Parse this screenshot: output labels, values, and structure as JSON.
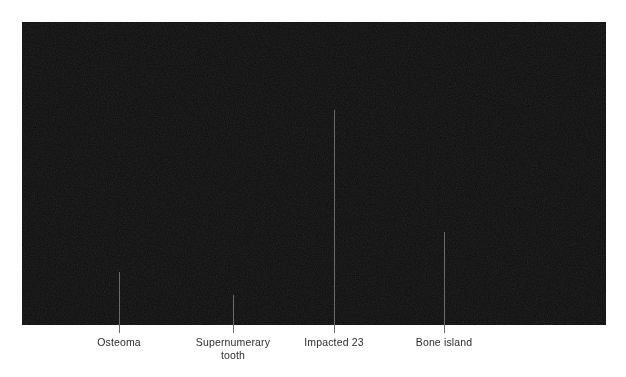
{
  "figure": {
    "type": "panoramic-dental-radiograph",
    "caption_labels": [
      {
        "id": "osteoma",
        "text": "Osteoma",
        "line_x": 119,
        "line_top": 272,
        "line_bottom": 333,
        "label_x": 119,
        "label_y": 336
      },
      {
        "id": "supernumerary-tooth",
        "text": "Supernumerary\ntooth",
        "line_x": 233,
        "line_top": 295,
        "line_bottom": 333,
        "label_x": 233,
        "label_y": 336
      },
      {
        "id": "impacted-23",
        "text": "Impacted 23",
        "line_x": 334,
        "line_top": 110,
        "line_bottom": 333,
        "label_x": 334,
        "label_y": 336
      },
      {
        "id": "bone-island",
        "text": "Bone island",
        "line_x": 444,
        "line_top": 232,
        "line_bottom": 333,
        "label_x": 444,
        "label_y": 336
      }
    ],
    "colors": {
      "page_background": "#ffffff",
      "label_text": "#2b2b2b",
      "leader_line": "#6b6b6b",
      "film_background": "#0b0b0b",
      "bone_bright": "#d8d4cc",
      "enamel_bright": "#efece4",
      "restoration_white": "#ffffff",
      "soft_tissue_mid": "#6e6e6e",
      "airway_dark": "#242424"
    },
    "radiograph": {
      "x": 22,
      "y": 22,
      "width": 584,
      "height": 303,
      "modality": "OPG",
      "findings": [
        "Osteoma — rounded radiopaque mass on lower border of left mandible",
        "Supernumerary tooth — small discrete tooth-like opacity below mandibular incisor region",
        "Impacted 23 — unerupted upper left canine superimposed in midline column",
        "Bone island — dense radiopacity in right mandibular body"
      ]
    }
  }
}
